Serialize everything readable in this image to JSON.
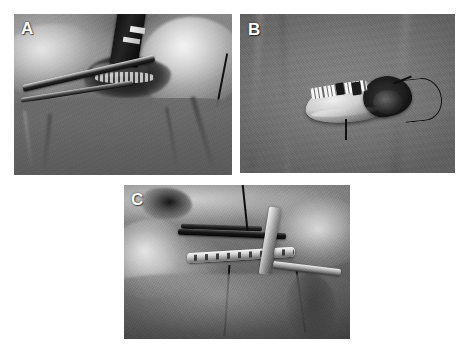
{
  "figure": {
    "background_color": "#ffffff",
    "width": 467,
    "height": 348,
    "layout": "three-panel composite, two on top row and one centered below",
    "rendering": "grayscale photographs"
  },
  "panels": [
    {
      "id": "A",
      "label": "A",
      "label_color": "#ffffff",
      "position": {
        "left": 14,
        "top": 14,
        "width": 218,
        "height": 161
      },
      "description": "Intraoperative view of the surgical field with retractor and forceps exposing the resection site; lower half covered by surgical drape",
      "dominant_color": "#6f6d69"
    },
    {
      "id": "B",
      "label": "B",
      "label_color": "#ffffff",
      "position": {
        "left": 240,
        "top": 14,
        "width": 215,
        "height": 159
      },
      "description": "Resected specimen with dentition and dark posterior tissue laid on a gray drape, with curled suture tail",
      "dominant_color": "#7b7876"
    },
    {
      "id": "C",
      "label": "C",
      "label_color": "#ffffff",
      "position": {
        "left": 124,
        "top": 185,
        "width": 226,
        "height": 154
      },
      "description": "Reconstruction plate with screw holes fixed in situ, metallic retractor and instrument bar in the operative field",
      "dominant_color": "#6b6864"
    }
  ]
}
